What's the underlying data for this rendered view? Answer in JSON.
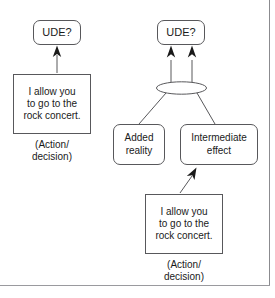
{
  "figure": {
    "frame": {
      "border_color": "#8b8b8f",
      "background": "#ffffff"
    },
    "style": {
      "line_color": "#58585b",
      "text_color": "#1a1a1a",
      "arrow_fill": "#1a1a1a"
    }
  },
  "left_diagram": {
    "name": "simple-cause-effect",
    "nodes": {
      "ude": {
        "label": "UDE?",
        "shape": "rounded-rectangle"
      },
      "action": {
        "label": "I allow you\nto go to the\nrock concert.",
        "shape": "rectangle"
      }
    },
    "caption": "(Action/\ndecision)",
    "arrows": [
      {
        "from": "action",
        "to": "ude",
        "style": "solid-filled-head"
      }
    ]
  },
  "right_diagram": {
    "name": "intermediate-effect-cause-effect",
    "nodes": {
      "ude": {
        "label": "UDE?",
        "shape": "rounded-rectangle"
      },
      "added_reality": {
        "label": "Added\nreality",
        "shape": "rounded-rectangle"
      },
      "intermediate_effect": {
        "label": "Intermediate\neffect",
        "shape": "rounded-rectangle"
      },
      "action": {
        "label": "I allow you\nto go to the\nrock concert.",
        "shape": "rectangle"
      }
    },
    "connector": {
      "type": "and-ellipse",
      "label": ""
    },
    "caption": "(Action/\ndecision)",
    "arrows": [
      {
        "from": "and-connector",
        "to": "ude",
        "style": "solid-filled-head",
        "count": 2
      },
      {
        "from": "added_reality",
        "to": "and-connector",
        "style": "plain-line"
      },
      {
        "from": "intermediate_effect",
        "to": "and-connector",
        "style": "plain-line"
      },
      {
        "from": "action",
        "to": "intermediate_effect",
        "style": "solid-filled-head"
      }
    ]
  }
}
